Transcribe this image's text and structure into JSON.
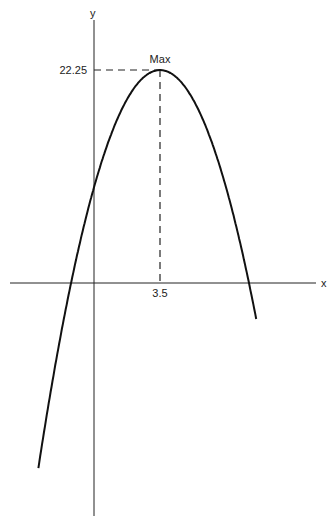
{
  "chart_data": {
    "type": "line",
    "title": "",
    "xlabel": "x",
    "ylabel": "y",
    "function": "y = -(x - 3.5)^2 + 22.25",
    "vertex": {
      "x": 3.5,
      "y": 22.25,
      "label": "Max"
    },
    "x_tick_labels": [
      "3.5"
    ],
    "y_tick_labels": [
      "22.25"
    ],
    "roots": [
      -1.22,
      8.22
    ],
    "y_intercept": 10,
    "xlim": [
      -4.5,
      11.5
    ],
    "ylim": [
      -24,
      29.5
    ],
    "grid": false,
    "legend": "none",
    "x": [
      -2.9,
      -2,
      -1,
      0,
      1,
      2,
      3,
      3.5,
      4,
      5,
      6,
      7,
      8,
      9,
      9.2
    ],
    "values": [
      -18.71,
      -8,
      2,
      10,
      16,
      20,
      22,
      22.25,
      22,
      20,
      16,
      10,
      2,
      -8,
      -10.59
    ]
  },
  "labels": {
    "y_axis": "y",
    "x_axis": "x",
    "max": "Max",
    "max_y": "22.25",
    "max_x": "3.5"
  }
}
